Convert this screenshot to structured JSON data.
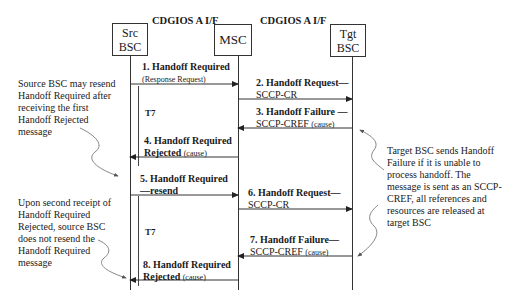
{
  "interfaces": [
    {
      "label": "CDGIOS A I/F"
    },
    {
      "label": "CDGIOS A I/F"
    }
  ],
  "entities": [
    {
      "id": "src",
      "line1": "Src",
      "line2": "BSC"
    },
    {
      "id": "msc",
      "line1": "MSC",
      "line2": ""
    },
    {
      "id": "tgt",
      "line1": "Tgt",
      "line2": "BSC"
    }
  ],
  "messages": [
    {
      "num": "1.",
      "title": "Handoff Required",
      "sub": "(Response Request)",
      "from": "src",
      "to": "msc"
    },
    {
      "num": "2.",
      "title": "Handoff Request—",
      "sub": "SCCP-CR",
      "from": "msc",
      "to": "tgt"
    },
    {
      "num": "3.",
      "title": "Handoff Failure —",
      "sub": "SCCP-CREF",
      "cause": "(cause)",
      "from": "tgt",
      "to": "msc"
    },
    {
      "num": "4.",
      "title": "Handoff Required",
      "title2": "Rejected",
      "cause": "(cause)",
      "from": "msc",
      "to": "src"
    },
    {
      "num": "5.",
      "title": "Handoff Required",
      "title2": "—resend",
      "from": "src",
      "to": "msc"
    },
    {
      "num": "6.",
      "title": "Handoff Request—",
      "sub": "SCCP-CR",
      "from": "msc",
      "to": "tgt"
    },
    {
      "num": "7.",
      "title": "Handoff Failure—",
      "sub": "SCCP-CREF",
      "cause": "(cause)",
      "from": "tgt",
      "to": "msc"
    },
    {
      "num": "8.",
      "title": "Handoff Required",
      "title2": "Rejected",
      "cause": "(cause)",
      "from": "msc",
      "to": "src"
    }
  ],
  "timers": [
    {
      "label": "T7"
    },
    {
      "label": "T7"
    }
  ],
  "notes": {
    "left_top": [
      "Source BSC may resend",
      "Handoff Required after",
      "receiving the first",
      "Handoff Rejected",
      "message"
    ],
    "left_bottom": [
      "Upon second receipt of",
      "Handoff Required",
      "Rejected, source BSC",
      "does not resend the",
      "Handoff Required",
      "message"
    ],
    "right": [
      "Target BSC sends Handoff",
      "Failure if it is unable to",
      "process handoff. The",
      "message is sent as an SCCP-",
      "CREF, all references and",
      "resources are released at",
      "target BSC"
    ]
  }
}
